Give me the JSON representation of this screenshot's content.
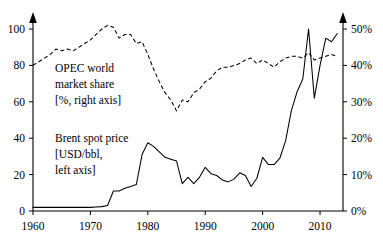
{
  "chart_data": {
    "type": "line",
    "title": "",
    "xlabel": "",
    "xlim": [
      1960,
      2014
    ],
    "xticks": [
      1960,
      1970,
      1980,
      1990,
      2000,
      2010
    ],
    "xticklabels": [
      "1960",
      "1970",
      "1980",
      "1990",
      "2000",
      "2010"
    ],
    "grid": false,
    "legend": "inline-annotations",
    "axes": [
      {
        "id": "left",
        "label": "Brent spot price [USD/bbl]",
        "ylim": [
          0,
          105
        ],
        "yticks": [
          0,
          20,
          40,
          60,
          80,
          100
        ],
        "yticklabels": [
          "0",
          "20",
          "40",
          "60",
          "80",
          "100"
        ]
      },
      {
        "id": "right",
        "label": "OPEC world market share [%]",
        "ylim": [
          0,
          52.5
        ],
        "yticks": [
          0,
          10,
          20,
          30,
          40,
          50
        ],
        "yticklabels": [
          "0%",
          "10%",
          "20%",
          "30%",
          "40%",
          "50%"
        ]
      }
    ],
    "annotations": [
      {
        "name": "opec-label",
        "lines": [
          "OPEC world",
          "market share",
          "[%, right axis]"
        ],
        "x": 1968,
        "y_left_units": 80
      },
      {
        "name": "brent-label",
        "lines": [
          "Brent spot price",
          "[USD/bbl,",
          "left axis]"
        ],
        "x": 1968,
        "y_left_units": 40
      }
    ],
    "series": [
      {
        "name": "Brent spot price",
        "axis": "left",
        "unit": "USD/bbl",
        "style": "solid",
        "x": [
          1960,
          1961,
          1962,
          1963,
          1964,
          1965,
          1966,
          1967,
          1968,
          1969,
          1970,
          1971,
          1972,
          1973,
          1974,
          1975,
          1976,
          1977,
          1978,
          1979,
          1980,
          1981,
          1982,
          1983,
          1984,
          1985,
          1986,
          1987,
          1988,
          1989,
          1990,
          1991,
          1992,
          1993,
          1994,
          1995,
          1996,
          1997,
          1998,
          1999,
          2000,
          2001,
          2002,
          2003,
          2004,
          2005,
          2006,
          2007,
          2008,
          2009,
          2010,
          2011,
          2012,
          2013
        ],
        "values": [
          2.0,
          2.0,
          2.0,
          2.0,
          2.0,
          2.0,
          2.0,
          2.0,
          2.0,
          2.0,
          2.0,
          2.2,
          2.4,
          3.0,
          11.0,
          11.0,
          12.5,
          13.5,
          14.5,
          31.0,
          37.5,
          35.5,
          32.5,
          29.5,
          28.5,
          27.5,
          15.0,
          18.5,
          15.0,
          18.5,
          24.0,
          20.5,
          19.5,
          17.0,
          16.0,
          17.5,
          21.0,
          19.5,
          13.5,
          18.0,
          29.5,
          25.5,
          25.5,
          29.0,
          38.5,
          55.0,
          65.5,
          72.5,
          100.0,
          62.0,
          80.0,
          95.0,
          93.0,
          97.5
        ]
      },
      {
        "name": "OPEC world market share",
        "axis": "right",
        "unit": "%",
        "style": "dashed",
        "x": [
          1960,
          1961,
          1962,
          1963,
          1964,
          1965,
          1966,
          1967,
          1968,
          1969,
          1970,
          1971,
          1972,
          1973,
          1974,
          1975,
          1976,
          1977,
          1978,
          1979,
          1980,
          1981,
          1982,
          1983,
          1984,
          1985,
          1986,
          1987,
          1988,
          1989,
          1990,
          1991,
          1992,
          1993,
          1994,
          1995,
          1996,
          1997,
          1998,
          1999,
          2000,
          2001,
          2002,
          2003,
          2004,
          2005,
          2006,
          2007,
          2008,
          2009,
          2010,
          2011,
          2012,
          2013
        ],
        "values": [
          40.0,
          41.0,
          42.0,
          43.0,
          44.5,
          44.0,
          44.5,
          44.0,
          45.0,
          46.0,
          47.0,
          48.5,
          50.0,
          51.0,
          50.5,
          47.5,
          48.5,
          48.5,
          46.0,
          46.5,
          43.0,
          39.0,
          35.5,
          32.5,
          30.5,
          27.5,
          30.5,
          30.0,
          32.5,
          33.5,
          35.5,
          36.5,
          38.5,
          39.5,
          39.5,
          40.0,
          40.5,
          41.5,
          42.0,
          40.5,
          41.5,
          40.5,
          39.5,
          41.0,
          42.0,
          42.5,
          42.5,
          42.0,
          43.5,
          41.5,
          42.0,
          42.5,
          43.0,
          42.5
        ],
        "values_left_axis_equivalent": [
          80,
          82,
          84,
          86,
          89,
          88,
          89,
          88,
          90,
          92,
          94,
          97,
          100,
          102,
          101,
          95,
          97,
          97,
          92,
          93,
          86,
          78,
          71,
          65,
          61,
          55,
          61,
          60,
          65,
          67,
          71,
          73,
          77,
          79,
          79,
          80,
          81,
          83,
          84,
          81,
          83,
          81,
          79,
          82,
          84,
          85,
          85,
          84,
          87,
          83,
          84,
          85,
          86,
          85
        ]
      }
    ]
  }
}
